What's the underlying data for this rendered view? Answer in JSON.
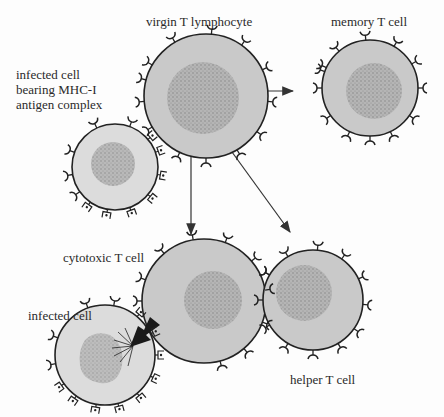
{
  "labels": {
    "virgin": "virgin T lymphocyte",
    "memory": "memory T cell",
    "infected_top_line1": "infected cell",
    "infected_top_line2": "bearing MHC-I",
    "infected_top_line3": "antigen complex",
    "cytotoxic": "cytotoxic T cell",
    "infected_bottom": "infected cell",
    "helper": "helper T cell"
  },
  "colors": {
    "cell_fill": "#c9c9c9",
    "infected_fill": "#dcdcdc",
    "nucleus": "#a9a9a9",
    "outline": "#222222",
    "arrow": "#333333"
  },
  "cells": [
    {
      "id": "virgin",
      "cx": 206,
      "cy": 96,
      "r": 62
    },
    {
      "id": "memory",
      "cx": 370,
      "cy": 88,
      "r": 48
    },
    {
      "id": "infected-top",
      "cx": 115,
      "cy": 167,
      "r": 43
    },
    {
      "id": "cytotoxic",
      "cx": 204,
      "cy": 301,
      "r": 62
    },
    {
      "id": "helper",
      "cx": 313,
      "cy": 300,
      "r": 50
    },
    {
      "id": "infected-bottom",
      "cx": 105,
      "cy": 355,
      "r": 50
    }
  ],
  "arrows": [
    {
      "from": "virgin",
      "to": "memory"
    },
    {
      "from": "virgin",
      "to": "cytotoxic"
    },
    {
      "from": "virgin",
      "to": "helper"
    }
  ]
}
